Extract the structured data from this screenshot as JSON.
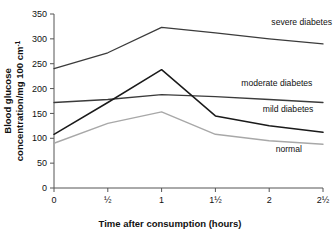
{
  "chart_data": {
    "type": "line",
    "title": "",
    "xlabel": "Time after consumption (hours)",
    "ylabel_line1": "Blood glucose",
    "ylabel_line2": "concentration/mg 100 cm",
    "ylabel_superscript": "-1",
    "x_tick_labels": [
      "0",
      "½",
      "1",
      "1½",
      "2",
      "2½"
    ],
    "x": [
      0,
      0.5,
      1,
      1.5,
      2,
      2.5
    ],
    "y_tick_labels": [
      "0",
      "50",
      "100",
      "150",
      "200",
      "250",
      "300",
      "350"
    ],
    "y_ticks": [
      0,
      50,
      100,
      150,
      200,
      250,
      300,
      350
    ],
    "xlim": [
      0,
      2.5
    ],
    "ylim": [
      0,
      350
    ],
    "grid": false,
    "legend_position": "inline-right",
    "series": [
      {
        "name": "severe diabetes",
        "label": "severe diabetes",
        "color": "#3b3b3b",
        "width": 1.3,
        "values": [
          240,
          272,
          323,
          312,
          300,
          290
        ],
        "label_x": 2.02,
        "label_y": 327
      },
      {
        "name": "moderate diabetes",
        "label": "moderate diabetes",
        "color": "#3b3b3b",
        "width": 1.3,
        "values": [
          172,
          178,
          188,
          184,
          178,
          172
        ],
        "label_x": 1.74,
        "label_y": 205
      },
      {
        "name": "mild diabetes",
        "label": "mild diabetes",
        "color": "#1a1a1a",
        "width": 1.5,
        "values": [
          108,
          172,
          238,
          145,
          125,
          112
        ],
        "label_x": 1.94,
        "label_y": 152
      },
      {
        "name": "normal",
        "label": "normal",
        "color": "#a8a8a8",
        "width": 1.4,
        "values": [
          90,
          130,
          153,
          108,
          95,
          88
        ],
        "label_x": 2.06,
        "label_y": 72
      }
    ]
  }
}
